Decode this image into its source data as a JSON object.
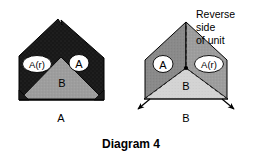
{
  "figure": {
    "caption": "Diagram 4",
    "note": {
      "line1": "Reverse",
      "line2": "side",
      "line3": "of unit"
    },
    "colors": {
      "dark_fill": "#1b1b1b",
      "mid_gray_fill": "#8a8a8a",
      "light_gray_fill": "#b0b0b0",
      "pale_gray_fill": "#d2d2d2",
      "outline": "#000000",
      "pill_fill": "#ffffff",
      "background": "#ffffff"
    },
    "left_unit": {
      "name": "front-side-unit",
      "flap_left_label": "A(r)",
      "flap_right_label": "A",
      "center_label": "B",
      "base_label": "A"
    },
    "right_unit": {
      "name": "reverse-side-unit",
      "flap_left_label": "A",
      "flap_right_label": "A(r)",
      "center_label": "B",
      "base_label": "B",
      "fold_line_style": "dashed",
      "apex_marker": "dot",
      "arrow_count": 2
    }
  }
}
